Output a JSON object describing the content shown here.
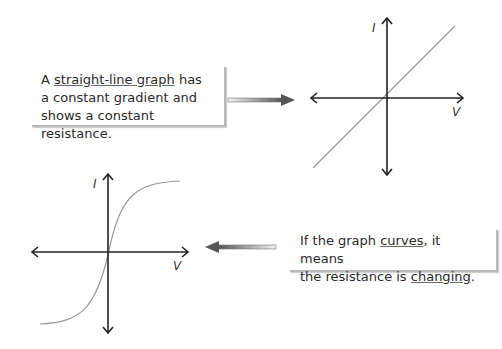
{
  "box_top": {
    "prefix": "A ",
    "underlined": "straight-line graph",
    "line1_rest": " has",
    "line2": "a constant gradient and",
    "line3": "shows a constant resistance."
  },
  "box_bottom": {
    "prefix": "If the graph ",
    "underlined1": "curves",
    "mid": ", it means",
    "line2_prefix": "the resistance is ",
    "underlined2": "changing",
    "suffix": "."
  },
  "graph_linear": {
    "y_label": "I",
    "x_label": "V",
    "type": "straight line through origin"
  },
  "graph_curve": {
    "y_label": "I",
    "x_label": "V",
    "type": "S-shaped curve through origin"
  },
  "colors": {
    "axis": "#222222",
    "curve": "#999999",
    "arrow": "#555555",
    "shadow": "#b8b8b8"
  }
}
